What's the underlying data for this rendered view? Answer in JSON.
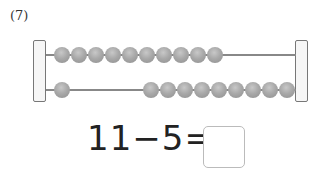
{
  "problem": {
    "number_label": "(7)",
    "equation": "11−5=",
    "answer": ""
  },
  "abacus": {
    "rows": [
      {
        "left_beads": 10,
        "right_beads": 0
      },
      {
        "left_beads": 1,
        "right_beads": 9
      }
    ],
    "bead_color": "#a9a9a9",
    "frame_color": "#777777"
  }
}
